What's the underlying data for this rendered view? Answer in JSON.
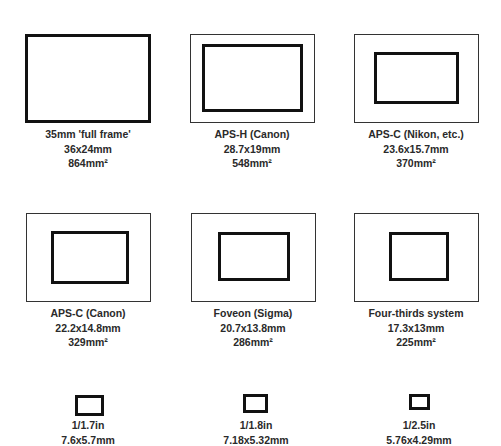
{
  "sensors": [
    {
      "name": "35mm 'full frame'",
      "dims": "36x24mm",
      "area": "864mm²"
    },
    {
      "name": "APS-H (Canon)",
      "dims": "28.7x19mm",
      "area": "548mm²"
    },
    {
      "name": "APS-C (Nikon, etc.)",
      "dims": "23.6x15.7mm",
      "area": "370mm²"
    },
    {
      "name": "APS-C (Canon)",
      "dims": "22.2x14.8mm",
      "area": "329mm²"
    },
    {
      "name": "Foveon (Sigma)",
      "dims": "20.7x13.8mm",
      "area": "286mm²"
    },
    {
      "name": "Four-thirds system",
      "dims": "17.3x13mm",
      "area": "225mm²"
    },
    {
      "name": "1/1.7in",
      "dims": "7.6x5.7mm"
    },
    {
      "name": "1/1.8in",
      "dims": "7.18x5.32mm"
    },
    {
      "name": "1/2.5in",
      "dims": "5.76x4.29mm"
    }
  ]
}
